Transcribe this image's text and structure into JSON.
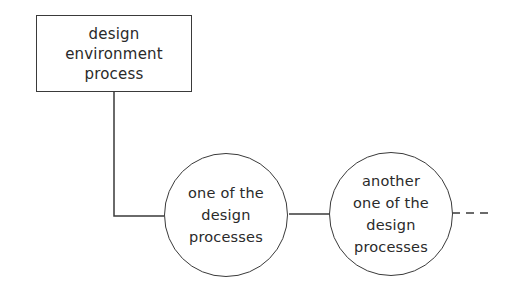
{
  "diagram": {
    "colors": {
      "stroke": "#3a3a3a",
      "text": "#2a2a2a",
      "background": "#ffffff"
    },
    "environment_box": {
      "shape": "rectangle",
      "lines": [
        "design",
        "environment",
        "process"
      ]
    },
    "process_nodes": [
      {
        "shape": "circle",
        "lines": [
          "one of the",
          "design",
          "processes"
        ]
      },
      {
        "shape": "circle",
        "lines": [
          "another",
          "one of the",
          "design",
          "processes"
        ]
      }
    ],
    "connectors": [
      {
        "from": "environment_box",
        "to": "process_nodes.0",
        "style": "solid",
        "route": "down-then-right"
      },
      {
        "from": "process_nodes.0",
        "to": "process_nodes.1",
        "style": "solid",
        "route": "horizontal"
      },
      {
        "from": "process_nodes.1",
        "to": "continuation",
        "style": "dashed",
        "route": "horizontal"
      }
    ]
  }
}
